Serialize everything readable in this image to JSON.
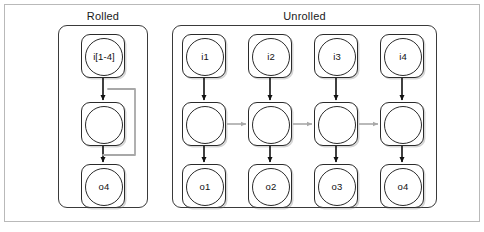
{
  "figure": {
    "width": 484,
    "height": 232,
    "background": "#ffffff",
    "frame_color": "#b9b9b9"
  },
  "colors": {
    "node_stroke": "#2b2b2b",
    "panel_stroke": "#3a3a3a",
    "arrow_black": "#111111",
    "arrow_gray": "#a8a8a8",
    "loop_gray": "#a8a8a8",
    "text": "#111111"
  },
  "panels": [
    {
      "id": "rolled",
      "title": "Rolled"
    },
    {
      "id": "unrolled",
      "title": "Unrolled"
    }
  ],
  "rolled": {
    "title": "Rolled",
    "nodes": [
      {
        "id": "rolled-input",
        "label": "i[1-4]",
        "role": "input"
      },
      {
        "id": "rolled-hidden",
        "label": "",
        "role": "hidden"
      },
      {
        "id": "rolled-output",
        "label": "o4",
        "role": "output"
      }
    ],
    "edges": [
      {
        "from": "rolled-input",
        "to": "rolled-hidden",
        "kind": "vertical",
        "color": "#111111"
      },
      {
        "from": "rolled-hidden",
        "to": "rolled-output",
        "kind": "vertical",
        "color": "#111111"
      },
      {
        "from": "rolled-hidden",
        "to": "rolled-hidden",
        "kind": "recurrent-loop",
        "color": "#a8a8a8"
      }
    ]
  },
  "unrolled": {
    "title": "Unrolled",
    "columns": [
      {
        "input": "i1",
        "hidden": "",
        "output": "o1"
      },
      {
        "input": "i2",
        "hidden": "",
        "output": "o2"
      },
      {
        "input": "i3",
        "hidden": "",
        "output": "o3"
      },
      {
        "input": "i4",
        "hidden": "",
        "output": "o4"
      }
    ],
    "vertical_edges_color": "#111111",
    "horizontal_edges_color": "#a8a8a8",
    "horizontal_edge_count": 3
  }
}
